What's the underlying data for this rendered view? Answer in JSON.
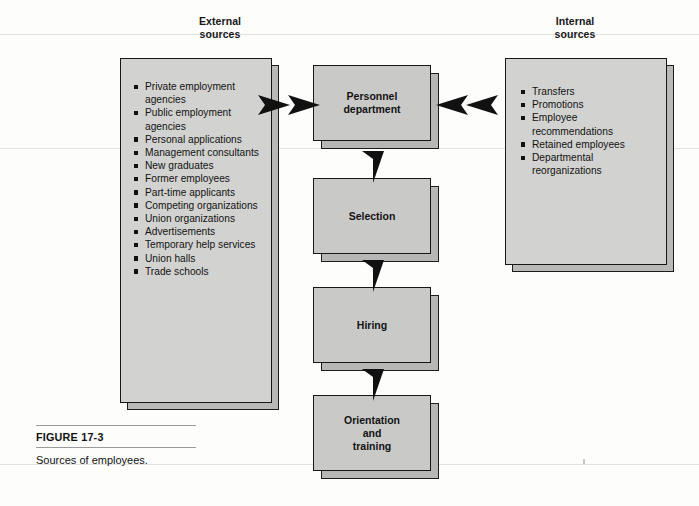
{
  "figure": {
    "caption_title": "FIGURE 17-3",
    "caption_text": "Sources of employees."
  },
  "columns": {
    "external_heading": "External\nsources",
    "internal_heading": "Internal\nsources"
  },
  "external_sources": [
    "Private employment agencies",
    "Public employment agencies",
    "Personal applications",
    "Management consultants",
    "New graduates",
    "Former employees",
    "Part-time applicants",
    "Competing organizations",
    "Union organizations",
    "Advertisements",
    "Temporary help services",
    "Union halls",
    "Trade schools"
  ],
  "internal_sources": [
    "Transfers",
    "Promotions",
    "Employee recommendations",
    "Retained employees",
    "Departmental reorganizations"
  ],
  "process_boxes": [
    {
      "id": "personnel",
      "label": "Personnel\ndepartment"
    },
    {
      "id": "selection",
      "label": "Selection"
    },
    {
      "id": "hiring",
      "label": "Hiring"
    },
    {
      "id": "orientation",
      "label": "Orientation\nand\ntraining"
    }
  ],
  "arrows": [
    {
      "name": "external-to-personnel-outer",
      "direction": "right"
    },
    {
      "name": "external-to-personnel-inner",
      "direction": "right"
    },
    {
      "name": "internal-to-personnel-inner",
      "direction": "left"
    },
    {
      "name": "internal-to-personnel-outer",
      "direction": "left"
    },
    {
      "name": "personnel-to-selection",
      "direction": "down"
    },
    {
      "name": "selection-to-hiring",
      "direction": "down"
    },
    {
      "name": "hiring-to-orientation",
      "direction": "down"
    }
  ],
  "colors": {
    "page_background": "#fdfdfc",
    "panel_face": "#d2d2d0",
    "process_face": "#c9c9c7",
    "shadow": "#b7b7b5",
    "outline": "#171717",
    "text": "#131313"
  }
}
